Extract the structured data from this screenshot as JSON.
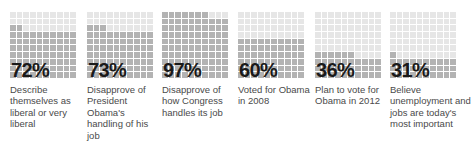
{
  "header": {
    "clipped_text": ""
  },
  "chart_data": {
    "type": "bar",
    "subtype": "waffle-grid",
    "title": "",
    "xlabel": "",
    "ylabel": "",
    "unit": "%",
    "grid": {
      "rows": 10,
      "cols": 10,
      "fill_direction": "bottom-up"
    },
    "ylim": [
      0,
      100
    ],
    "categories": [
      "Describe themselves as liberal or very liberal",
      "Disapprove of President Obama's handling of his job",
      "Disapprove of how Congress handles its job",
      "Voted for Obama in 2008",
      "Plan to vote for Obama in 2012",
      "Believe unemployment and jobs are today's most important"
    ],
    "values": [
      72,
      73,
      97,
      60,
      36,
      31
    ],
    "colors": {
      "filled": "#b3b3b3",
      "empty": "#e6e6e6",
      "value_text": "#1a1a1a",
      "caption_text": "#4a4a4a"
    }
  },
  "stats": [
    {
      "value_label": "72%",
      "value": 72,
      "caption": "Describe themselves as liberal or very liberal"
    },
    {
      "value_label": "73%",
      "value": 73,
      "caption": "Disapprove of President Obama's handling of his job"
    },
    {
      "value_label": "97%",
      "value": 97,
      "caption": "Disapprove of how Congress handles its job"
    },
    {
      "value_label": "60%",
      "value": 60,
      "caption": "Voted for Obama in 2008"
    },
    {
      "value_label": "36%",
      "value": 36,
      "caption": "Plan to vote for Obama in 2012"
    },
    {
      "value_label": "31%",
      "value": 31,
      "caption": "Believe unemployment and jobs are today's most important"
    }
  ]
}
